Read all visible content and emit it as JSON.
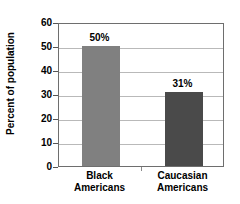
{
  "chart_data": {
    "type": "bar",
    "title": "",
    "xlabel": "",
    "ylabel": "Percent of population",
    "categories": [
      "Black\nAmericans",
      "Caucasian\nAmericans"
    ],
    "category_lines": [
      [
        "Black",
        "Americans"
      ],
      [
        "Caucasian",
        "Americans"
      ]
    ],
    "values": [
      50,
      31
    ],
    "value_labels": [
      "50%",
      "31%"
    ],
    "bar_colors": [
      "#808080",
      "#4a4a4a"
    ],
    "ylim": [
      0,
      60
    ],
    "ytick_values": [
      0,
      10,
      20,
      30,
      40,
      50,
      60
    ],
    "ytick_labels": [
      "0",
      "10",
      "20",
      "30",
      "40",
      "50",
      "60"
    ],
    "grid": true,
    "grid_color": "#b9b9b9",
    "legend": false,
    "legend_position": "none",
    "axis_color": "#6e6e6e",
    "text_color": "#000000",
    "background": "#ffffff"
  }
}
